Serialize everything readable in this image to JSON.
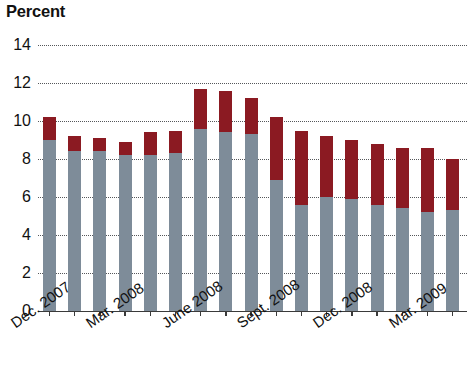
{
  "chart_data": {
    "type": "bar",
    "stacked": true,
    "title": "Percent",
    "xlabel": "",
    "ylabel": "Percent",
    "ylim": [
      0,
      14
    ],
    "ytick_step": 2,
    "ytick_labels": [
      "14",
      "12",
      "10",
      "8",
      "6",
      "4",
      "2",
      "0"
    ],
    "grid": true,
    "grid_style": "dotted",
    "legend": "none",
    "colors": {
      "series_bottom": "#7e8c99",
      "series_top": "#8b1a22",
      "axis": "#3a3a3a",
      "grid": "#55575a",
      "background": "#ffffff",
      "text": "#111111"
    },
    "categories": [
      "Dec. 2007",
      "Jan. 2008",
      "Feb. 2008",
      "Mar. 2008",
      "Apr. 2008",
      "May 2008",
      "June 2008",
      "July 2008",
      "Aug. 2008",
      "Sept. 2008",
      "Oct. 2008",
      "Nov. 2008",
      "Dec. 2008",
      "Jan. 2009",
      "Feb. 2009",
      "Mar. 2009",
      "Apr. 2009"
    ],
    "axis_tick_labels": [
      "Dec. 2007",
      "Mar. 2008",
      "June 2008",
      "Sept. 2008",
      "Dec. 2008",
      "Mar. 2009"
    ],
    "axis_tick_indices": [
      0,
      3,
      6,
      9,
      12,
      15
    ],
    "series": [
      {
        "name": "bottom",
        "values": [
          9.0,
          8.4,
          8.4,
          8.2,
          8.2,
          8.3,
          9.6,
          9.4,
          9.3,
          6.9,
          5.6,
          6.0,
          5.9,
          5.6,
          5.4,
          5.2,
          5.3
        ]
      },
      {
        "name": "top",
        "values": [
          1.2,
          0.8,
          0.7,
          0.7,
          1.2,
          1.2,
          2.1,
          2.2,
          1.9,
          3.3,
          3.9,
          3.2,
          3.1,
          3.2,
          3.2,
          3.4,
          2.7
        ]
      }
    ],
    "totals": [
      10.2,
      9.2,
      9.1,
      8.9,
      9.4,
      9.5,
      11.7,
      11.6,
      11.2,
      10.2,
      9.5,
      9.2,
      9.0,
      8.8,
      8.6,
      8.6,
      8.0
    ]
  }
}
